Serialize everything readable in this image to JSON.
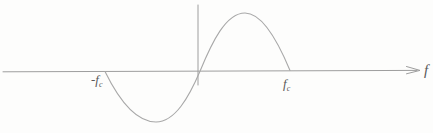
{
  "figure": {
    "type": "curve-sketch",
    "axis": {
      "label": "f"
    },
    "tick_labels": {
      "neg_fc": {
        "main": "-f",
        "sub": "c"
      },
      "pos_fc": {
        "main": "f",
        "sub": "c"
      }
    },
    "colors": {
      "line": "#a8a8a8",
      "axis": "#9e9e9e",
      "text": "#595959",
      "background": "#fdfdfc"
    },
    "key_points": {
      "left_zero_crossing": [
        105,
        71
      ],
      "minimum": [
        156,
        122
      ],
      "origin_crossing": [
        200,
        71
      ],
      "maximum": [
        245,
        13
      ],
      "right_zero_crossing": [
        290,
        71
      ],
      "vertical_axis_x": 198,
      "horizontal_axis_y": 71
    }
  }
}
